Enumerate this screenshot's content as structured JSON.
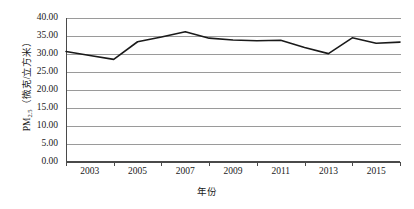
{
  "chart_data": {
    "type": "line",
    "title": "",
    "xlabel": "年份",
    "ylabel": "PM2.5（微克/立方米）",
    "ylabel_main": "PM",
    "ylabel_sub": "2.5",
    "ylabel_unit": "（微克/立方米）",
    "xlim": [
      2002,
      2016
    ],
    "ylim": [
      0,
      40
    ],
    "ytick_step": 5,
    "grid": true,
    "legend": "none",
    "series": [
      {
        "name": "PM2.5",
        "color": "#1a1a1a",
        "x": [
          2002,
          2003,
          2004,
          2005,
          2006,
          2007,
          2008,
          2009,
          2010,
          2011,
          2012,
          2013,
          2014,
          2015,
          2016
        ],
        "values": [
          30.7,
          29.6,
          28.5,
          33.4,
          34.7,
          36.2,
          34.4,
          33.9,
          33.7,
          33.8,
          31.8,
          30.1,
          34.5,
          33.0,
          33.3
        ]
      }
    ],
    "y_tick_labels": [
      "40.00",
      "35.00",
      "30.00",
      "25.00",
      "20.00",
      "15.00",
      "10.00",
      "5.00",
      "0.00"
    ],
    "y_tick_values": [
      40,
      35,
      30,
      25,
      20,
      15,
      10,
      5,
      0
    ],
    "x_tick_labels": [
      "2003",
      "2005",
      "2007",
      "2009",
      "2011",
      "2013",
      "2015"
    ],
    "x_tick_values": [
      2003,
      2005,
      2007,
      2009,
      2011,
      2013,
      2015
    ],
    "line_points": [
      {
        "year": 2002,
        "value": 30.7
      },
      {
        "year": 2003,
        "value": 29.6
      },
      {
        "year": 2004,
        "value": 28.5
      },
      {
        "year": 2005,
        "value": 33.4
      },
      {
        "year": 2006,
        "value": 34.7
      },
      {
        "year": 2007,
        "value": 36.2
      },
      {
        "year": 2008,
        "value": 34.4
      },
      {
        "year": 2009,
        "value": 33.9
      },
      {
        "year": 2010,
        "value": 33.7
      },
      {
        "year": 2011,
        "value": 33.8
      },
      {
        "year": 2012,
        "value": 31.8
      },
      {
        "year": 2013,
        "value": 30.1
      },
      {
        "year": 2014,
        "value": 34.5
      },
      {
        "year": 2015,
        "value": 33.0
      },
      {
        "year": 2016,
        "value": 33.3
      }
    ]
  },
  "colors": {
    "line": "#1a1a1a",
    "grid": "#9a9a9a",
    "axis": "#4a4a4a",
    "text": "#1a1a1a",
    "background": "#ffffff"
  }
}
